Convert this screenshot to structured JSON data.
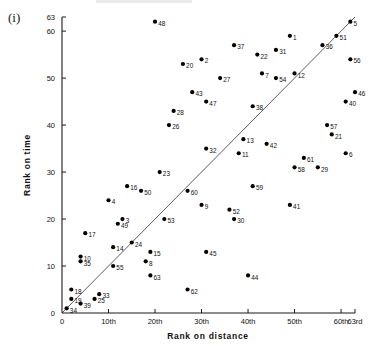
{
  "panel": {
    "label": "(i)"
  },
  "chart_data": {
    "type": "scatter",
    "title": "",
    "xlabel": "Rank on distance",
    "ylabel": "Rank on time",
    "xlim": [
      0,
      63
    ],
    "ylim": [
      0,
      63
    ],
    "grid": false,
    "legend": null,
    "reference_line": {
      "type": "identity",
      "from": [
        0,
        0
      ],
      "to": [
        63,
        63
      ],
      "description": "y = x diagonal line"
    },
    "xticks": [
      {
        "value": 0,
        "label": "0"
      },
      {
        "value": 10,
        "label": "10th"
      },
      {
        "value": 20,
        "label": "20th"
      },
      {
        "value": 30,
        "label": "30th"
      },
      {
        "value": 40,
        "label": "40th"
      },
      {
        "value": 50,
        "label": "50th"
      },
      {
        "value": 60,
        "label": "60th"
      },
      {
        "value": 63,
        "label": "63rd"
      }
    ],
    "yticks": [
      {
        "value": 0,
        "label": "0"
      },
      {
        "value": 10,
        "label": "10"
      },
      {
        "value": 20,
        "label": "20"
      },
      {
        "value": 30,
        "label": "30"
      },
      {
        "value": 40,
        "label": "40"
      },
      {
        "value": 50,
        "label": "50"
      },
      {
        "value": 60,
        "label": "60"
      },
      {
        "value": 63,
        "label": "63"
      }
    ],
    "points": [
      {
        "label": "48",
        "x": 20,
        "y": 62
      },
      {
        "label": "1",
        "x": 49,
        "y": 59
      },
      {
        "label": "5",
        "x": 62,
        "y": 62
      },
      {
        "label": "51",
        "x": 59,
        "y": 59
      },
      {
        "label": "36",
        "x": 56,
        "y": 57
      },
      {
        "label": "37",
        "x": 37,
        "y": 57
      },
      {
        "label": "22",
        "x": 42,
        "y": 55
      },
      {
        "label": "31",
        "x": 46,
        "y": 56
      },
      {
        "label": "56",
        "x": 62,
        "y": 54
      },
      {
        "label": "20",
        "x": 26,
        "y": 53
      },
      {
        "label": "2",
        "x": 30,
        "y": 54
      },
      {
        "label": "7",
        "x": 43,
        "y": 51
      },
      {
        "label": "54",
        "x": 46,
        "y": 50
      },
      {
        "label": "12",
        "x": 50,
        "y": 51
      },
      {
        "label": "27",
        "x": 34,
        "y": 50
      },
      {
        "label": "43",
        "x": 28,
        "y": 47
      },
      {
        "label": "47",
        "x": 31,
        "y": 45
      },
      {
        "label": "46",
        "x": 63,
        "y": 47
      },
      {
        "label": "40",
        "x": 61,
        "y": 45
      },
      {
        "label": "38",
        "x": 41,
        "y": 44
      },
      {
        "label": "28",
        "x": 24,
        "y": 43
      },
      {
        "label": "26",
        "x": 23,
        "y": 40
      },
      {
        "label": "57",
        "x": 57,
        "y": 40
      },
      {
        "label": "21",
        "x": 58,
        "y": 38
      },
      {
        "label": "13",
        "x": 39,
        "y": 37
      },
      {
        "label": "42",
        "x": 44,
        "y": 36
      },
      {
        "label": "32",
        "x": 31,
        "y": 35
      },
      {
        "label": "11",
        "x": 38,
        "y": 34
      },
      {
        "label": "6",
        "x": 61,
        "y": 34
      },
      {
        "label": "61",
        "x": 52,
        "y": 33
      },
      {
        "label": "58",
        "x": 50,
        "y": 31
      },
      {
        "label": "29",
        "x": 55,
        "y": 31
      },
      {
        "label": "23",
        "x": 21,
        "y": 30
      },
      {
        "label": "16",
        "x": 14,
        "y": 27
      },
      {
        "label": "50",
        "x": 17,
        "y": 26
      },
      {
        "label": "60",
        "x": 27,
        "y": 26
      },
      {
        "label": "59",
        "x": 41,
        "y": 27
      },
      {
        "label": "4",
        "x": 10,
        "y": 24
      },
      {
        "label": "9",
        "x": 30,
        "y": 23
      },
      {
        "label": "52",
        "x": 36,
        "y": 22
      },
      {
        "label": "3",
        "x": 13,
        "y": 20
      },
      {
        "label": "49",
        "x": 12,
        "y": 19
      },
      {
        "label": "53",
        "x": 22,
        "y": 20
      },
      {
        "label": "30",
        "x": 37,
        "y": 20
      },
      {
        "label": "41",
        "x": 49,
        "y": 23
      },
      {
        "label": "17",
        "x": 5,
        "y": 17
      },
      {
        "label": "14",
        "x": 11,
        "y": 14
      },
      {
        "label": "24",
        "x": 15,
        "y": 15
      },
      {
        "label": "15",
        "x": 19,
        "y": 13
      },
      {
        "label": "10",
        "x": 4,
        "y": 12
      },
      {
        "label": "35",
        "x": 4,
        "y": 11
      },
      {
        "label": "55",
        "x": 11,
        "y": 10
      },
      {
        "label": "8",
        "x": 18,
        "y": 11
      },
      {
        "label": "63",
        "x": 19,
        "y": 8
      },
      {
        "label": "45",
        "x": 31,
        "y": 13
      },
      {
        "label": "44",
        "x": 40,
        "y": 8
      },
      {
        "label": "62",
        "x": 27,
        "y": 5
      },
      {
        "label": "18",
        "x": 2,
        "y": 5
      },
      {
        "label": "19",
        "x": 2,
        "y": 3
      },
      {
        "label": "39",
        "x": 4,
        "y": 2
      },
      {
        "label": "25",
        "x": 7,
        "y": 3
      },
      {
        "label": "33",
        "x": 8,
        "y": 4
      },
      {
        "label": "34",
        "x": 1,
        "y": 1
      }
    ]
  }
}
